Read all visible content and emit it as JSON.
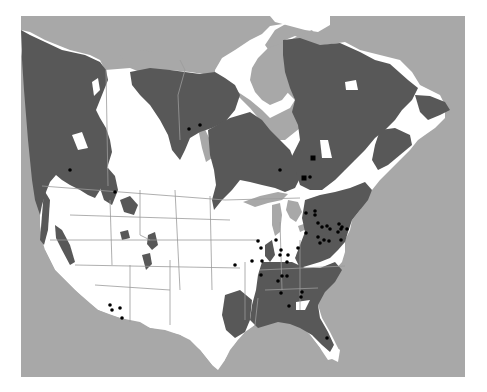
{
  "map": {
    "title": "",
    "region": "North America",
    "colors": {
      "background": "#ffffff",
      "water": "#a8a8a8",
      "land": "#ffffff",
      "range": "#585858",
      "borders": "#9a9a9a",
      "points": "#000000"
    },
    "frame": {
      "x": 21,
      "y": 16,
      "width": 444,
      "height": 361
    },
    "legend": null,
    "point_records": [
      {
        "x": 70,
        "y": 170,
        "shape": "circle"
      },
      {
        "x": 115,
        "y": 192,
        "shape": "circle"
      },
      {
        "x": 189,
        "y": 129,
        "shape": "circle"
      },
      {
        "x": 200,
        "y": 125,
        "shape": "circle"
      },
      {
        "x": 313,
        "y": 158,
        "shape": "square"
      },
      {
        "x": 280,
        "y": 170,
        "shape": "circle"
      },
      {
        "x": 304,
        "y": 178,
        "shape": "square"
      },
      {
        "x": 310,
        "y": 177,
        "shape": "circle"
      },
      {
        "x": 306,
        "y": 213,
        "shape": "circle"
      },
      {
        "x": 315,
        "y": 211,
        "shape": "circle"
      },
      {
        "x": 315,
        "y": 215,
        "shape": "circle"
      },
      {
        "x": 318,
        "y": 223,
        "shape": "circle"
      },
      {
        "x": 322,
        "y": 227,
        "shape": "circle"
      },
      {
        "x": 327,
        "y": 226,
        "shape": "circle"
      },
      {
        "x": 330,
        "y": 229,
        "shape": "circle"
      },
      {
        "x": 339,
        "y": 224,
        "shape": "circle"
      },
      {
        "x": 342,
        "y": 227,
        "shape": "circle"
      },
      {
        "x": 341,
        "y": 229,
        "shape": "circle"
      },
      {
        "x": 338,
        "y": 232,
        "shape": "circle"
      },
      {
        "x": 306,
        "y": 233,
        "shape": "circle"
      },
      {
        "x": 318,
        "y": 237,
        "shape": "circle"
      },
      {
        "x": 320,
        "y": 243,
        "shape": "circle"
      },
      {
        "x": 324,
        "y": 240,
        "shape": "circle"
      },
      {
        "x": 329,
        "y": 241,
        "shape": "circle"
      },
      {
        "x": 341,
        "y": 240,
        "shape": "circle"
      },
      {
        "x": 347,
        "y": 229,
        "shape": "circle"
      },
      {
        "x": 258,
        "y": 241,
        "shape": "circle"
      },
      {
        "x": 261,
        "y": 248,
        "shape": "circle"
      },
      {
        "x": 276,
        "y": 240,
        "shape": "circle"
      },
      {
        "x": 281,
        "y": 250,
        "shape": "circle"
      },
      {
        "x": 280,
        "y": 255,
        "shape": "circle"
      },
      {
        "x": 288,
        "y": 255,
        "shape": "circle"
      },
      {
        "x": 298,
        "y": 248,
        "shape": "circle"
      },
      {
        "x": 287,
        "y": 262,
        "shape": "circle"
      },
      {
        "x": 235,
        "y": 265,
        "shape": "circle"
      },
      {
        "x": 252,
        "y": 261,
        "shape": "circle"
      },
      {
        "x": 262,
        "y": 261,
        "shape": "circle"
      },
      {
        "x": 261,
        "y": 275,
        "shape": "circle"
      },
      {
        "x": 282,
        "y": 276,
        "shape": "circle"
      },
      {
        "x": 287,
        "y": 276,
        "shape": "circle"
      },
      {
        "x": 278,
        "y": 281,
        "shape": "circle"
      },
      {
        "x": 281,
        "y": 293,
        "shape": "circle"
      },
      {
        "x": 302,
        "y": 292,
        "shape": "circle"
      },
      {
        "x": 301,
        "y": 297,
        "shape": "circle"
      },
      {
        "x": 289,
        "y": 306,
        "shape": "circle"
      },
      {
        "x": 327,
        "y": 338,
        "shape": "circle"
      },
      {
        "x": 110,
        "y": 305,
        "shape": "circle"
      },
      {
        "x": 112,
        "y": 310,
        "shape": "circle"
      },
      {
        "x": 120,
        "y": 308,
        "shape": "circle"
      },
      {
        "x": 122,
        "y": 318,
        "shape": "circle"
      }
    ]
  }
}
